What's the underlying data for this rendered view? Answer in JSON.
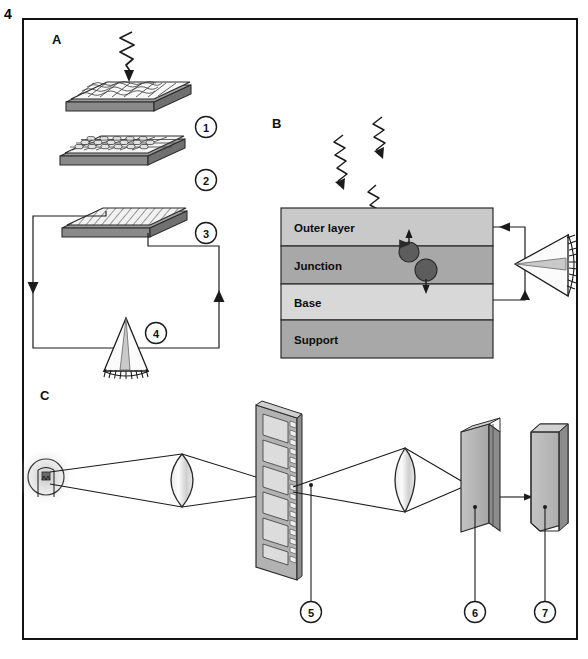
{
  "figure": {
    "number": "4",
    "panels": [
      {
        "id": "A",
        "letter": "A"
      },
      {
        "id": "B",
        "letter": "B"
      },
      {
        "id": "C",
        "letter": "C"
      }
    ]
  },
  "panel_a": {
    "letter": "A",
    "incident_ray_icon": "zigzag-photon-arrow-icon",
    "layers": [
      {
        "callout": "1",
        "texture": "cellular-mosaic"
      },
      {
        "callout": "2",
        "texture": "rounded-cell-grid"
      },
      {
        "callout": "3",
        "texture": "diagonal-hatch"
      }
    ],
    "meter": {
      "callout": "4",
      "icon": "fan-meter-icon"
    },
    "circuit": {
      "left_arrow_icon": "arrow-down-icon",
      "right_arrow_icon": "arrow-up-icon"
    }
  },
  "panel_b": {
    "letter": "B",
    "bands": [
      {
        "label": "Outer layer",
        "fill": "#c9c9c9"
      },
      {
        "label": "Junction",
        "fill": "#a8a8a8"
      },
      {
        "label": "Base",
        "fill": "#d8d8d8"
      },
      {
        "label": "Support",
        "fill": "#a8a8a8"
      }
    ],
    "photons": [
      "zigzag-photon-arrow-icon",
      "zigzag-photon-arrow-icon",
      "zigzag-photon-arrow-icon"
    ],
    "carriers": [
      {
        "name": "electron",
        "direction": "up"
      },
      {
        "name": "hole",
        "direction": "down"
      }
    ],
    "meter": {
      "icon": "fan-meter-icon"
    },
    "leads": {
      "top_arrow_icon": "arrow-left-icon",
      "bottom_arrow_icon": "arrow-up-icon"
    }
  },
  "panel_c": {
    "letter": "C",
    "components": [
      {
        "name": "lamp",
        "icon": "light-bulb-icon",
        "callout": null
      },
      {
        "name": "condenser-lens",
        "icon": "biconvex-lens-icon",
        "callout": null
      },
      {
        "name": "film-strip",
        "icon": "film-strip-icon",
        "callout": "5"
      },
      {
        "name": "projection-lens",
        "icon": "biconvex-lens-icon",
        "callout": null
      },
      {
        "name": "sensor-block",
        "icon": "sensor-block-icon",
        "callout": "6"
      },
      {
        "name": "display-block",
        "icon": "display-block-icon",
        "callout": "7"
      }
    ]
  },
  "colors": {
    "ink": "#1b1b1b",
    "paper": "#ffffff",
    "band_light": "#d8d8d8",
    "band_mid": "#c9c9c9",
    "band_dark": "#a8a8a8",
    "carrier": "#5a5a5a",
    "block_face": "#b4b4b4",
    "block_side": "#8f8f8f"
  }
}
